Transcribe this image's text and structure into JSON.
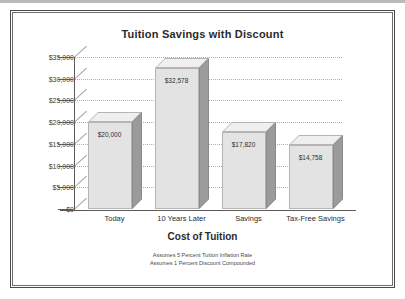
{
  "chart_data": {
    "type": "bar",
    "title": "Tuition Savings with Discount",
    "xlabel": "Cost of Tuition",
    "ylabel": "",
    "categories": [
      "Today",
      "10 Years Later",
      "Savings",
      "Tax-Free Savings"
    ],
    "values": [
      20000,
      32578,
      17820,
      14758
    ],
    "value_labels": [
      "$20,000",
      "$32,578",
      "$17,820",
      "$14,758"
    ],
    "ylim": [
      0,
      35000
    ],
    "ytick_labels": [
      "$35,000",
      "$30,000",
      "$25,000",
      "$20,000",
      "$15,000",
      "$10,000",
      "$5,000",
      "$0"
    ],
    "ytick_values": [
      35000,
      30000,
      25000,
      20000,
      15000,
      10000,
      5000,
      0
    ],
    "grid": true,
    "legend": "none",
    "style": "3d-bar",
    "annotations": [
      "Assumes 5 Percent Tuition Inflation Rate",
      "Assumes 1 Percent Discount Compounded"
    ]
  },
  "colors": {
    "bar_front": "#e3e3e3",
    "bar_top": "#efefef",
    "bar_side": "#9b9b9b",
    "axis": "#5a5a5a",
    "grid": "#adadad",
    "text": "#2b2b2b",
    "frame": "#4a4a4a"
  }
}
